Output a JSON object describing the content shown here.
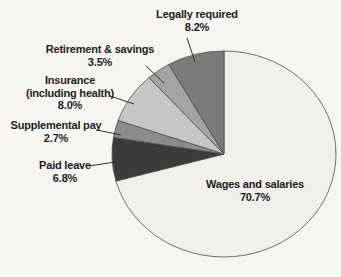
{
  "page": {
    "background_color": "#f6f5f1",
    "text_color": "#1d1d1d"
  },
  "chart_data": {
    "type": "pie",
    "title": "",
    "start_angle_deg": 0,
    "direction": "clockwise",
    "outline_color": "#4d4d4d",
    "leader_line_color": "#2f2f2f",
    "slices": [
      {
        "label": "Wages and salaries",
        "value": 70.7,
        "pct_label": "70.7%",
        "color": "#f0efe9",
        "label_lines": [
          "Wages and salaries",
          "70.7%"
        ]
      },
      {
        "label": "Paid leave",
        "value": 6.8,
        "pct_label": "6.8%",
        "color": "#3b3b3b",
        "label_lines": [
          "Paid leave",
          "6.8%"
        ]
      },
      {
        "label": "Supplemental pay",
        "value": 2.7,
        "pct_label": "2.7%",
        "color": "#8c8c8c",
        "label_lines": [
          "Supplemental pay",
          "2.7%"
        ]
      },
      {
        "label": "Insurance (including health)",
        "value": 8.0,
        "pct_label": "8.0%",
        "color": "#c6c6c6",
        "label_lines": [
          "Insurance",
          "(including health)",
          "8.0%"
        ]
      },
      {
        "label": "Retirement & savings",
        "value": 3.5,
        "pct_label": "3.5%",
        "color": "#a3a3a3",
        "label_lines": [
          "Retirement & savings",
          "3.5%"
        ]
      },
      {
        "label": "Legally required",
        "value": 8.2,
        "pct_label": "8.2%",
        "color": "#7b7b7b",
        "label_lines": [
          "Legally required",
          "8.2%"
        ]
      }
    ]
  }
}
